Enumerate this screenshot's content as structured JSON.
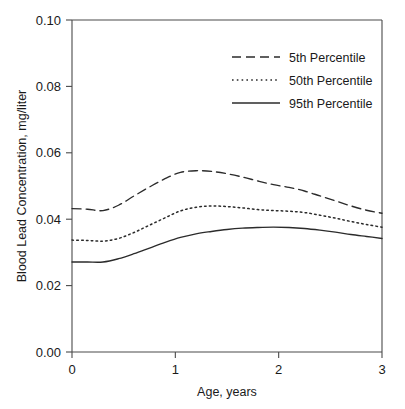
{
  "chart_data": {
    "type": "line",
    "title": "",
    "subtitle": "",
    "xlabel": "Age, years",
    "ylabel": "Blood Lead Concentration, mg/liter",
    "xlim": [
      0,
      3
    ],
    "ylim": [
      0.0,
      0.1
    ],
    "xticks": [
      0,
      1,
      2,
      3
    ],
    "xtick_labels": [
      "0",
      "1",
      "2",
      "3"
    ],
    "yticks": [
      0.0,
      0.02,
      0.04,
      0.06,
      0.08,
      0.1
    ],
    "ytick_labels": [
      "0.00",
      "0.02",
      "0.04",
      "0.06",
      "0.08",
      "0.10"
    ],
    "grid": false,
    "legend_position": "upper right",
    "x": [
      0.0,
      0.15,
      0.3,
      0.45,
      0.6,
      0.75,
      0.9,
      1.05,
      1.2,
      1.35,
      1.5,
      1.65,
      1.8,
      1.95,
      2.1,
      2.25,
      2.4,
      2.55,
      2.7,
      2.85,
      3.0
    ],
    "series": [
      {
        "name": "5th Percentile",
        "style": "dashed",
        "color": "#2b2b2b",
        "values": [
          0.0432,
          0.043,
          0.0426,
          0.0442,
          0.047,
          0.0497,
          0.0522,
          0.0541,
          0.0546,
          0.0544,
          0.0537,
          0.0527,
          0.0515,
          0.0504,
          0.0496,
          0.0485,
          0.047,
          0.0455,
          0.044,
          0.0427,
          0.0418
        ]
      },
      {
        "name": "50th Percentile",
        "style": "dotted",
        "color": "#2b2b2b",
        "values": [
          0.0337,
          0.0336,
          0.0334,
          0.0342,
          0.036,
          0.0382,
          0.0404,
          0.0425,
          0.0436,
          0.044,
          0.0438,
          0.0434,
          0.0429,
          0.0426,
          0.0424,
          0.042,
          0.0412,
          0.0403,
          0.0393,
          0.0384,
          0.0376
        ]
      },
      {
        "name": "95th Percentile",
        "style": "solid",
        "color": "#2b2b2b",
        "values": [
          0.0271,
          0.0271,
          0.0271,
          0.0281,
          0.0296,
          0.0313,
          0.033,
          0.0345,
          0.0356,
          0.0363,
          0.0369,
          0.0373,
          0.0375,
          0.0376,
          0.0375,
          0.0372,
          0.0367,
          0.0361,
          0.0354,
          0.0348,
          0.0342
        ]
      }
    ]
  },
  "legend": {
    "entries": [
      {
        "label": "5th Percentile"
      },
      {
        "label": "50th Percentile"
      },
      {
        "label": "95th Percentile"
      }
    ]
  }
}
